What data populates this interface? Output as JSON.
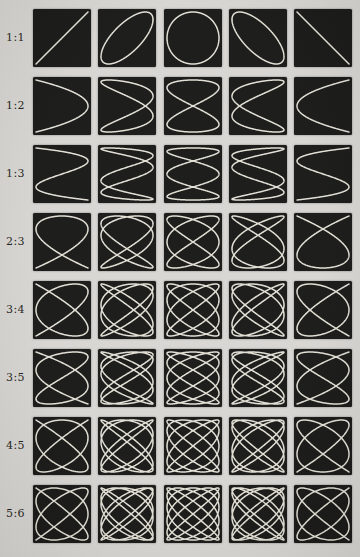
{
  "page": {
    "background_color": "#d7d5d1",
    "label_color": "#1e1d1b"
  },
  "figure": {
    "type": "lissajous-grid",
    "columns": 5,
    "cell": {
      "background_color": "#151514",
      "curve_color": "#eceade"
    },
    "rows": [
      {
        "label": "1:1",
        "y_freq": 1,
        "x_freq": 1,
        "phases_deg": [
          0,
          45,
          90,
          135,
          180
        ]
      },
      {
        "label": "1:2",
        "y_freq": 1,
        "x_freq": 2,
        "phases_deg": [
          90,
          135,
          180,
          225,
          270
        ]
      },
      {
        "label": "1:3",
        "y_freq": 1,
        "x_freq": 3,
        "phases_deg": [
          0,
          45,
          90,
          135,
          180
        ]
      },
      {
        "label": "2:3",
        "y_freq": 2,
        "x_freq": 3,
        "phases_deg": [
          45,
          67.5,
          90,
          112.5,
          135
        ]
      },
      {
        "label": "3:4",
        "y_freq": 3,
        "x_freq": 4,
        "phases_deg": [
          150,
          165,
          180,
          195,
          210
        ]
      },
      {
        "label": "3:5",
        "y_freq": 3,
        "x_freq": 5,
        "phases_deg": [
          0,
          15,
          30,
          45,
          60
        ]
      },
      {
        "label": "4:5",
        "y_freq": 4,
        "x_freq": 5,
        "phases_deg": [
          247.5,
          258.75,
          270,
          281.25,
          292.5
        ]
      },
      {
        "label": "5:6",
        "y_freq": 5,
        "x_freq": 6,
        "phases_deg": [
          162,
          171,
          180,
          189,
          198
        ]
      }
    ]
  },
  "chart_data": {
    "type": "line",
    "title": "",
    "subtitle": "",
    "description_visible_text": [
      "1:1",
      "1:2",
      "1:3",
      "2:3",
      "3:4",
      "3:5",
      "4:5",
      "5:6"
    ],
    "series": [
      {
        "name": "1:1",
        "equation_x": "sin(1*t + phi)",
        "equation_y": "sin(1*t)",
        "phases_deg": [
          0,
          45,
          90,
          135,
          180
        ]
      },
      {
        "name": "1:2",
        "equation_x": "sin(2*t + phi)",
        "equation_y": "sin(1*t)",
        "phases_deg": [
          90,
          135,
          180,
          225,
          270
        ]
      },
      {
        "name": "1:3",
        "equation_x": "sin(3*t + phi)",
        "equation_y": "sin(1*t)",
        "phases_deg": [
          0,
          45,
          90,
          135,
          180
        ]
      },
      {
        "name": "2:3",
        "equation_x": "sin(3*t + phi)",
        "equation_y": "sin(2*t)",
        "phases_deg": [
          45,
          67.5,
          90,
          112.5,
          135
        ]
      },
      {
        "name": "3:4",
        "equation_x": "sin(4*t + phi)",
        "equation_y": "sin(3*t)",
        "phases_deg": [
          150,
          165,
          180,
          195,
          210
        ]
      },
      {
        "name": "3:5",
        "equation_x": "sin(5*t + phi)",
        "equation_y": "sin(3*t)",
        "phases_deg": [
          0,
          15,
          30,
          45,
          60
        ]
      },
      {
        "name": "4:5",
        "equation_x": "sin(5*t + phi)",
        "equation_y": "sin(4*t)",
        "phases_deg": [
          247.5,
          258.75,
          270,
          281.25,
          292.5
        ]
      },
      {
        "name": "5:6",
        "equation_x": "sin(6*t + phi)",
        "equation_y": "sin(5*t)",
        "phases_deg": [
          162,
          171,
          180,
          189,
          198
        ]
      }
    ],
    "xlim": [
      -1,
      1
    ],
    "ylim": [
      -1,
      1
    ],
    "grid": false,
    "legend": "none"
  }
}
